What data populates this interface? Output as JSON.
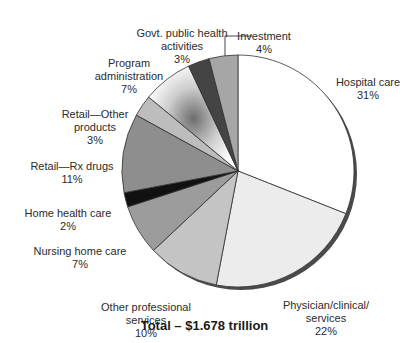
{
  "chart_data": {
    "type": "pie",
    "title": "Total – $1.678 trillion",
    "start_angle_deg": 0,
    "direction": "clockwise",
    "slices": [
      {
        "label": "Hospital care",
        "value": 31,
        "color": "#ffffff"
      },
      {
        "label": "Physician/clinical/ services",
        "value": 22,
        "color": "#ececec"
      },
      {
        "label": "Other professional services",
        "value": 10,
        "color": "#c4c4c4"
      },
      {
        "label": "Nursing home care",
        "value": 7,
        "color": "#9c9c9c"
      },
      {
        "label": "Home health care",
        "value": 2,
        "color": "#111111"
      },
      {
        "label": "Retail—Rx drugs",
        "value": 11,
        "color": "#8e8e8e"
      },
      {
        "label": "Retail—Other products",
        "value": 3,
        "color": "#bdbdbd"
      },
      {
        "label": "Program administration",
        "value": 7,
        "color": "gradient"
      },
      {
        "label": "Govt. public health activities",
        "value": 3,
        "color": "#444444"
      },
      {
        "label": "Investment",
        "value": 4,
        "color": "#a6a6a6"
      }
    ]
  },
  "labels": {
    "hospital": {
      "name": "Hospital care",
      "pct": "31%"
    },
    "physician": {
      "name": "Physician/clinical/\nservices",
      "pct": "22%"
    },
    "other_prof": {
      "name": "Other professional\nservices",
      "pct": "10%"
    },
    "nursing": {
      "name": "Nursing home care",
      "pct": "7%"
    },
    "home_health": {
      "name": "Home health care",
      "pct": "2%"
    },
    "rx": {
      "name": "Retail—Rx drugs",
      "pct": "11%"
    },
    "retail_other": {
      "name": "Retail—Other\nproducts",
      "pct": "3%"
    },
    "program_admin": {
      "name": "Program\nadministration",
      "pct": "7%"
    },
    "govt": {
      "name": "Govt. public health\nactivities",
      "pct": "3%"
    },
    "investment": {
      "name": "Investment",
      "pct": "4%"
    }
  },
  "title": "Total – $1.678 trillion"
}
